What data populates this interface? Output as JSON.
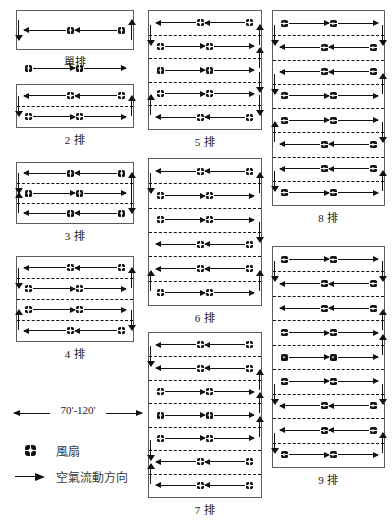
{
  "figure": {
    "title_bottom": "",
    "dimension_label": "70'-120'",
    "legend": {
      "fan_label": "風扇",
      "fan_icon": "fan-propeller-icon",
      "airflow_label": "空氣流動方向",
      "airflow_icon": "right-arrow-icon"
    }
  },
  "panels": [
    {
      "id": "panel-1",
      "caption": "單排",
      "rows": 1,
      "column": "left",
      "x": 16,
      "y": 10,
      "w": 118,
      "h": 40,
      "flows": [
        "left",
        "right"
      ],
      "separators": 0,
      "edge_ticks": [
        {
          "side": "left",
          "dir": "down",
          "at": 0.5
        },
        {
          "side": "right",
          "dir": "up",
          "at": 0.5
        }
      ]
    },
    {
      "id": "panel-2",
      "caption": "2 排",
      "rows": 2,
      "column": "left",
      "x": 16,
      "y": 84,
      "w": 118,
      "h": 44,
      "flows": [
        "left",
        "right"
      ],
      "separators": 1,
      "edge_ticks": [
        {
          "side": "left",
          "dir": "down",
          "at": 1
        },
        {
          "side": "right",
          "dir": "up",
          "at": 1
        }
      ]
    },
    {
      "id": "panel-3",
      "caption": "3 排",
      "rows": 3,
      "column": "left",
      "x": 16,
      "y": 162,
      "w": 118,
      "h": 62,
      "flows": [
        "left",
        "right",
        "left"
      ],
      "separators": 2,
      "edge_ticks": [
        {
          "side": "left",
          "dir": "down",
          "at": 1
        },
        {
          "side": "right",
          "dir": "up",
          "at": 1
        },
        {
          "side": "left",
          "dir": "up",
          "at": 2
        },
        {
          "side": "right",
          "dir": "down",
          "at": 2
        }
      ]
    },
    {
      "id": "panel-4",
      "caption": "4 排",
      "rows": 4,
      "column": "left",
      "x": 16,
      "y": 256,
      "w": 118,
      "h": 86,
      "flows": [
        "left",
        "right",
        "right",
        "left"
      ],
      "separators": 3,
      "edge_ticks": [
        {
          "side": "left",
          "dir": "down",
          "at": 1
        },
        {
          "side": "right",
          "dir": "up",
          "at": 1
        },
        {
          "side": "left",
          "dir": "up",
          "at": 3
        },
        {
          "side": "right",
          "dir": "down",
          "at": 3
        }
      ]
    },
    {
      "id": "panel-5",
      "caption": "5 排",
      "rows": 5,
      "column": "middle",
      "x": 148,
      "y": 10,
      "w": 114,
      "h": 120,
      "flows": [
        "left",
        "right",
        "right",
        "right",
        "left"
      ],
      "separators": 4,
      "edge_ticks": [
        {
          "side": "left",
          "dir": "down",
          "at": 1
        },
        {
          "side": "right",
          "dir": "up",
          "at": 1
        },
        {
          "side": "right",
          "dir": "up",
          "at": 2
        },
        {
          "side": "right",
          "dir": "down",
          "at": 3
        },
        {
          "side": "left",
          "dir": "up",
          "at": 4
        },
        {
          "side": "right",
          "dir": "down",
          "at": 4
        }
      ]
    },
    {
      "id": "panel-6",
      "caption": "6 排",
      "rows": 6,
      "column": "middle",
      "x": 148,
      "y": 158,
      "w": 114,
      "h": 148,
      "flows": [
        "left",
        "right",
        "right",
        "left",
        "left",
        "right"
      ],
      "separators": 5,
      "edge_ticks": [
        {
          "side": "left",
          "dir": "down",
          "at": 1
        },
        {
          "side": "right",
          "dir": "up",
          "at": 1
        },
        {
          "side": "right",
          "dir": "down",
          "at": 3
        },
        {
          "side": "left",
          "dir": "up",
          "at": 5
        },
        {
          "side": "right",
          "dir": "up",
          "at": 5
        }
      ]
    },
    {
      "id": "panel-7",
      "caption": "7 排",
      "rows": 7,
      "column": "middle",
      "x": 148,
      "y": 332,
      "w": 114,
      "h": 166,
      "flows": [
        "left",
        "left",
        "right",
        "right",
        "right",
        "left",
        "left"
      ],
      "separators": 6,
      "edge_ticks": [
        {
          "side": "left",
          "dir": "down",
          "at": 1
        },
        {
          "side": "right",
          "dir": "up",
          "at": 2
        },
        {
          "side": "right",
          "dir": "up",
          "at": 3
        },
        {
          "side": "right",
          "dir": "up",
          "at": 4
        },
        {
          "side": "left",
          "dir": "down",
          "at": 5
        },
        {
          "side": "left",
          "dir": "up",
          "at": 6
        }
      ]
    },
    {
      "id": "panel-8",
      "caption": "8 排",
      "rows": 8,
      "column": "right",
      "x": 272,
      "y": 10,
      "w": 113,
      "h": 196,
      "flows": [
        "right",
        "left",
        "left",
        "right",
        "right",
        "left",
        "left",
        "right"
      ],
      "separators": 7,
      "edge_ticks": [
        {
          "side": "left",
          "dir": "down",
          "at": 1
        },
        {
          "side": "right",
          "dir": "down",
          "at": 1
        },
        {
          "side": "left",
          "dir": "down",
          "at": 3
        },
        {
          "side": "right",
          "dir": "up",
          "at": 3
        },
        {
          "side": "left",
          "dir": "up",
          "at": 5
        },
        {
          "side": "right",
          "dir": "down",
          "at": 5
        },
        {
          "side": "left",
          "dir": "down",
          "at": 7
        },
        {
          "side": "right",
          "dir": "up",
          "at": 7
        }
      ]
    },
    {
      "id": "panel-9",
      "caption": "9 排",
      "rows": 9,
      "column": "right",
      "x": 272,
      "y": 246,
      "w": 113,
      "h": 222,
      "flows": [
        "right",
        "left",
        "left",
        "right",
        "right",
        "right",
        "left",
        "left",
        "right"
      ],
      "separators": 8,
      "edge_ticks": [
        {
          "side": "left",
          "dir": "down",
          "at": 1
        },
        {
          "side": "right",
          "dir": "down",
          "at": 1
        },
        {
          "side": "right",
          "dir": "up",
          "at": 3
        },
        {
          "side": "right",
          "dir": "up",
          "at": 4
        },
        {
          "side": "left",
          "dir": "down",
          "at": 6
        },
        {
          "side": "right",
          "dir": "down",
          "at": 6
        },
        {
          "side": "left",
          "dir": "down",
          "at": 8
        },
        {
          "side": "right",
          "dir": "up",
          "at": 8
        }
      ]
    }
  ]
}
